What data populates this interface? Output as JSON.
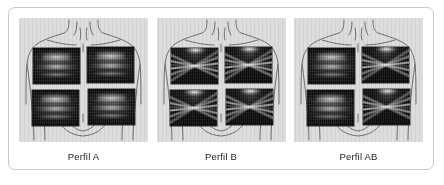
{
  "figure": {
    "caption_present": false,
    "panels": [
      {
        "label": "Perfil A",
        "name": "panel-perfil-a",
        "torso_view": "anterior-thorax-diagram",
        "zones": [
          {
            "position": "upper-left",
            "profile": "A"
          },
          {
            "position": "upper-right",
            "profile": "A"
          },
          {
            "position": "lower-left",
            "profile": "A"
          },
          {
            "position": "lower-right",
            "profile": "A"
          }
        ]
      },
      {
        "label": "Perfil B",
        "name": "panel-perfil-b",
        "torso_view": "anterior-thorax-diagram",
        "zones": [
          {
            "position": "upper-left",
            "profile": "B"
          },
          {
            "position": "upper-right",
            "profile": "B"
          },
          {
            "position": "lower-left",
            "profile": "B"
          },
          {
            "position": "lower-right",
            "profile": "B"
          }
        ]
      },
      {
        "label": "Perfil AB",
        "name": "panel-perfil-ab",
        "torso_view": "anterior-thorax-diagram",
        "zones": [
          {
            "position": "upper-left",
            "profile": "A"
          },
          {
            "position": "upper-right",
            "profile": "B"
          },
          {
            "position": "lower-left",
            "profile": "A"
          },
          {
            "position": "lower-right",
            "profile": "B"
          }
        ]
      }
    ]
  },
  "colors": {
    "frame_border": "#c9c9c9",
    "page_background": "#ffffff",
    "photo_background": "#dddddd",
    "torso_outline": "#6f6f6f",
    "ultrasound_background": "#121212",
    "label_text": "#1c1c1c"
  }
}
